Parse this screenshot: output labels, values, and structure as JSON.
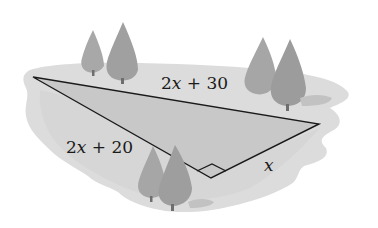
{
  "diagram": {
    "type": "right-triangle-on-land",
    "labels": {
      "hypotenuse": {
        "coef": "2",
        "var": "x",
        "rest": " + 30"
      },
      "left_leg": {
        "coef": "2",
        "var": "x",
        "rest": " + 20"
      },
      "right_leg": {
        "var": "x"
      }
    },
    "vertices": {
      "left": [
        33,
        77
      ],
      "right": [
        319,
        124
      ],
      "right_angle": [
        211,
        178
      ]
    },
    "colors": {
      "ground": "#d9d9d9",
      "ground_edge": "#e6e6e6",
      "triangle_fill": "#c9c9c9",
      "line": "#1a1a1a",
      "tree": "#a6a6a6",
      "tree_dark": "#9a9a9a",
      "trunk": "#6e6e6e"
    }
  }
}
